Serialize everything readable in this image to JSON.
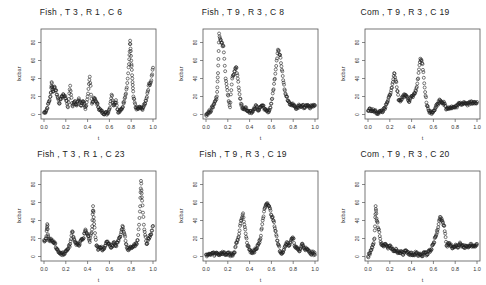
{
  "chart_data": [
    {
      "type": "scatter",
      "title": "Fish , T 3 , R 1 , C 6",
      "xlabel": "t",
      "ylabel": "Ixcbar",
      "xlim": [
        0,
        1
      ],
      "ylim": [
        -5,
        95
      ],
      "xticks": [
        "0.0",
        "0.2",
        "0.4",
        "0.6",
        "0.8",
        "1.0"
      ],
      "yticks": [
        0,
        20,
        40,
        60,
        80
      ],
      "grid": false,
      "x": [
        0.0,
        0.02,
        0.04,
        0.06,
        0.07,
        0.08,
        0.1,
        0.12,
        0.14,
        0.16,
        0.18,
        0.2,
        0.22,
        0.24,
        0.26,
        0.28,
        0.3,
        0.32,
        0.34,
        0.36,
        0.38,
        0.4,
        0.42,
        0.44,
        0.46,
        0.48,
        0.5,
        0.52,
        0.54,
        0.56,
        0.58,
        0.6,
        0.62,
        0.64,
        0.66,
        0.68,
        0.7,
        0.72,
        0.74,
        0.76,
        0.78,
        0.79,
        0.8,
        0.81,
        0.82,
        0.84,
        0.86,
        0.88,
        0.9,
        0.92,
        0.94,
        0.96,
        0.98,
        1.0
      ],
      "y": [
        2,
        4,
        12,
        20,
        36,
        26,
        30,
        22,
        12,
        20,
        22,
        18,
        8,
        32,
        10,
        14,
        10,
        18,
        10,
        14,
        6,
        20,
        42,
        12,
        18,
        14,
        8,
        4,
        2,
        2,
        1,
        6,
        22,
        10,
        16,
        2,
        4,
        8,
        18,
        30,
        56,
        82,
        60,
        40,
        20,
        8,
        6,
        8,
        6,
        10,
        18,
        32,
        36,
        52
      ]
    },
    {
      "type": "scatter",
      "title": "Fish , T 9 , R 3 , C 8",
      "xlabel": "t",
      "ylabel": "Ixcbar",
      "xlim": [
        0,
        1
      ],
      "ylim": [
        -5,
        95
      ],
      "xticks": [
        "0.0",
        "0.2",
        "0.4",
        "0.6",
        "0.8",
        "1.0"
      ],
      "yticks": [
        0,
        20,
        40,
        60,
        80
      ],
      "grid": false,
      "x": [
        0.0,
        0.02,
        0.04,
        0.06,
        0.08,
        0.1,
        0.11,
        0.12,
        0.14,
        0.16,
        0.18,
        0.2,
        0.22,
        0.24,
        0.26,
        0.28,
        0.3,
        0.32,
        0.34,
        0.36,
        0.38,
        0.4,
        0.42,
        0.44,
        0.46,
        0.48,
        0.5,
        0.52,
        0.54,
        0.56,
        0.58,
        0.6,
        0.62,
        0.64,
        0.66,
        0.68,
        0.7,
        0.72,
        0.74,
        0.76,
        0.78,
        0.8,
        0.82,
        0.84,
        0.86,
        0.88,
        0.9,
        0.92,
        0.94,
        0.96,
        0.98,
        1.0
      ],
      "y": [
        0,
        2,
        4,
        8,
        14,
        20,
        46,
        90,
        80,
        76,
        40,
        22,
        8,
        40,
        48,
        52,
        30,
        12,
        6,
        8,
        4,
        2,
        2,
        6,
        10,
        4,
        8,
        10,
        6,
        4,
        4,
        12,
        28,
        50,
        72,
        66,
        48,
        28,
        20,
        14,
        12,
        10,
        8,
        8,
        10,
        10,
        8,
        10,
        10,
        8,
        10,
        10
      ]
    },
    {
      "type": "scatter",
      "title": "Com , T 9 , R 3 , C 19",
      "xlabel": "t",
      "ylabel": "Ixcbar",
      "xlim": [
        0,
        1
      ],
      "ylim": [
        -5,
        95
      ],
      "xticks": [
        "0.0",
        "0.2",
        "0.4",
        "0.6",
        "0.8",
        "1.0"
      ],
      "yticks": [
        0,
        20,
        40,
        60,
        80
      ],
      "grid": false,
      "x": [
        0.0,
        0.02,
        0.04,
        0.06,
        0.08,
        0.1,
        0.12,
        0.14,
        0.16,
        0.18,
        0.2,
        0.22,
        0.24,
        0.26,
        0.28,
        0.3,
        0.32,
        0.34,
        0.36,
        0.38,
        0.4,
        0.42,
        0.44,
        0.46,
        0.48,
        0.5,
        0.52,
        0.54,
        0.56,
        0.58,
        0.6,
        0.62,
        0.64,
        0.66,
        0.68,
        0.7,
        0.72,
        0.74,
        0.76,
        0.78,
        0.8,
        0.82,
        0.84,
        0.86,
        0.88,
        0.9,
        0.92,
        0.94,
        0.96,
        0.98,
        1.0
      ],
      "y": [
        4,
        6,
        4,
        4,
        2,
        2,
        4,
        4,
        8,
        14,
        22,
        30,
        46,
        36,
        16,
        16,
        20,
        22,
        20,
        14,
        20,
        22,
        26,
        40,
        62,
        56,
        30,
        10,
        4,
        2,
        4,
        8,
        12,
        16,
        14,
        12,
        6,
        8,
        8,
        8,
        8,
        10,
        12,
        12,
        14,
        12,
        12,
        14,
        12,
        14,
        14
      ]
    },
    {
      "type": "scatter",
      "title": "Fish , T 3 , R 1 , C 23",
      "xlabel": "t",
      "ylabel": "Ixcbar",
      "xlim": [
        0,
        1
      ],
      "ylim": [
        -5,
        95
      ],
      "xticks": [
        "0.0",
        "0.2",
        "0.4",
        "0.6",
        "0.8",
        "1.0"
      ],
      "yticks": [
        0,
        20,
        40,
        60,
        80
      ],
      "grid": false,
      "x": [
        0.0,
        0.02,
        0.03,
        0.04,
        0.06,
        0.08,
        0.1,
        0.12,
        0.14,
        0.16,
        0.18,
        0.2,
        0.22,
        0.24,
        0.26,
        0.28,
        0.3,
        0.32,
        0.34,
        0.36,
        0.38,
        0.4,
        0.42,
        0.44,
        0.45,
        0.46,
        0.48,
        0.5,
        0.52,
        0.54,
        0.56,
        0.58,
        0.6,
        0.62,
        0.64,
        0.66,
        0.68,
        0.7,
        0.72,
        0.74,
        0.76,
        0.78,
        0.8,
        0.82,
        0.84,
        0.86,
        0.88,
        0.89,
        0.9,
        0.92,
        0.94,
        0.96,
        0.98,
        1.0
      ],
      "y": [
        18,
        20,
        36,
        20,
        18,
        18,
        14,
        8,
        4,
        4,
        2,
        6,
        8,
        14,
        28,
        18,
        14,
        12,
        18,
        20,
        30,
        24,
        16,
        30,
        56,
        36,
        12,
        8,
        10,
        8,
        12,
        16,
        14,
        10,
        16,
        12,
        18,
        22,
        34,
        24,
        10,
        8,
        10,
        12,
        12,
        18,
        50,
        84,
        62,
        30,
        14,
        20,
        24,
        34
      ]
    },
    {
      "type": "scatter",
      "title": "Fish , T 9 , R 3 , C 19",
      "xlabel": "t",
      "ylabel": "Ixcbar",
      "xlim": [
        0,
        1
      ],
      "ylim": [
        -5,
        95
      ],
      "xticks": [
        "0.0",
        "0.2",
        "0.4",
        "0.6",
        "0.8",
        "1.0"
      ],
      "yticks": [
        0,
        20,
        40,
        60,
        80
      ],
      "grid": false,
      "x": [
        0.0,
        0.02,
        0.04,
        0.06,
        0.08,
        0.1,
        0.12,
        0.14,
        0.16,
        0.18,
        0.2,
        0.22,
        0.24,
        0.26,
        0.28,
        0.3,
        0.32,
        0.34,
        0.36,
        0.38,
        0.4,
        0.42,
        0.44,
        0.46,
        0.48,
        0.5,
        0.52,
        0.54,
        0.56,
        0.58,
        0.6,
        0.62,
        0.64,
        0.66,
        0.68,
        0.7,
        0.72,
        0.74,
        0.76,
        0.78,
        0.8,
        0.82,
        0.84,
        0.86,
        0.88,
        0.9,
        0.92,
        0.94,
        0.96,
        0.98,
        1.0
      ],
      "y": [
        2,
        2,
        2,
        4,
        2,
        4,
        2,
        4,
        4,
        2,
        4,
        2,
        2,
        4,
        16,
        22,
        40,
        48,
        30,
        12,
        8,
        4,
        6,
        8,
        14,
        20,
        40,
        54,
        58,
        56,
        46,
        40,
        28,
        14,
        6,
        4,
        10,
        16,
        12,
        18,
        20,
        10,
        8,
        6,
        14,
        10,
        8,
        6,
        4,
        4,
        2
      ]
    },
    {
      "type": "scatter",
      "title": "Com , T 9 , R 3 , C 20",
      "xlabel": "t",
      "ylabel": "Ixcbar",
      "xlim": [
        0,
        1
      ],
      "ylim": [
        -5,
        95
      ],
      "xticks": [
        "0.0",
        "0.2",
        "0.4",
        "0.6",
        "0.8",
        "1.0"
      ],
      "yticks": [
        0,
        20,
        40,
        60,
        80
      ],
      "grid": false,
      "x": [
        0.0,
        0.02,
        0.04,
        0.06,
        0.07,
        0.08,
        0.1,
        0.12,
        0.14,
        0.16,
        0.18,
        0.2,
        0.22,
        0.24,
        0.26,
        0.28,
        0.3,
        0.32,
        0.34,
        0.36,
        0.38,
        0.4,
        0.42,
        0.44,
        0.46,
        0.48,
        0.5,
        0.52,
        0.54,
        0.56,
        0.58,
        0.6,
        0.62,
        0.64,
        0.66,
        0.68,
        0.7,
        0.72,
        0.74,
        0.76,
        0.78,
        0.8,
        0.82,
        0.84,
        0.86,
        0.88,
        0.9,
        0.92,
        0.94,
        0.96,
        0.98,
        1.0
      ],
      "y": [
        0,
        4,
        10,
        20,
        56,
        40,
        30,
        14,
        12,
        14,
        10,
        12,
        8,
        6,
        8,
        4,
        6,
        2,
        6,
        4,
        2,
        4,
        2,
        4,
        2,
        2,
        2,
        4,
        2,
        6,
        8,
        14,
        22,
        30,
        44,
        40,
        34,
        12,
        14,
        12,
        10,
        12,
        10,
        14,
        12,
        10,
        12,
        10,
        14,
        12,
        12,
        14
      ]
    }
  ],
  "panels": [
    {
      "title": "Fish , T 3 , R 1 , C 6"
    },
    {
      "title": "Fish , T 9 , R 3 , C 8"
    },
    {
      "title": "Com , T 9 , R 3 , C 19"
    },
    {
      "title": "Fish , T 3 , R 1 , C 23"
    },
    {
      "title": "Fish , T 9 , R 3 , C 19"
    },
    {
      "title": "Com , T 9 , R 3 , C 20"
    }
  ]
}
